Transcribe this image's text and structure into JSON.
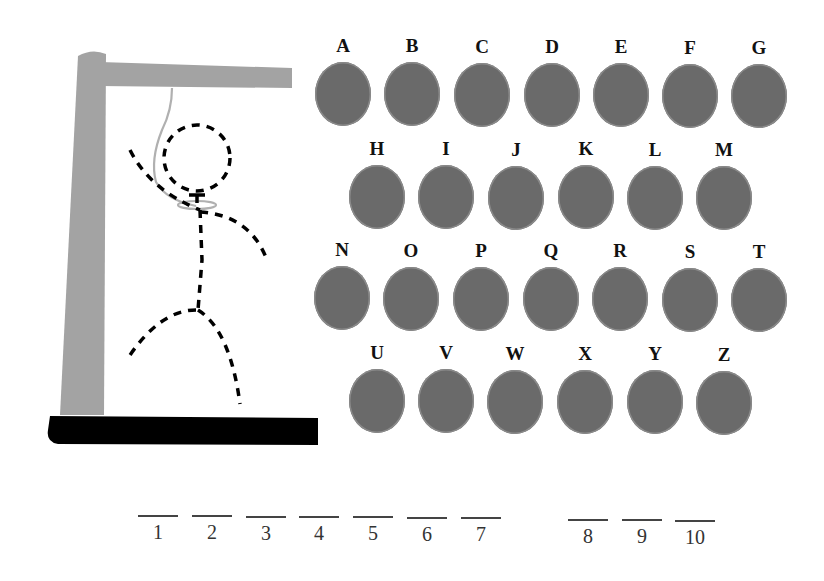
{
  "gallows": {
    "post_color": "#a3a3a3",
    "base_color": "#000000",
    "rope_color": "#b0b0b0",
    "figure_color": "#000000",
    "figure_style": "dashed",
    "parts_drawn": [
      "head",
      "body",
      "left-arm",
      "right-arm",
      "left-leg",
      "right-leg"
    ]
  },
  "letters": {
    "disc_color": "#6a6a6a",
    "rows": [
      [
        "A",
        "B",
        "C",
        "D",
        "E",
        "F",
        "G"
      ],
      [
        "H",
        "I",
        "J",
        "K",
        "L",
        "M"
      ],
      [
        "N",
        "O",
        "P",
        "Q",
        "R",
        "S",
        "T"
      ],
      [
        "U",
        "V",
        "W",
        "X",
        "Y",
        "Z"
      ]
    ]
  },
  "word": {
    "length": 10,
    "groups": [
      7,
      3
    ],
    "blanks": [
      "1",
      "2",
      "3",
      "4",
      "5",
      "6",
      "7",
      "8",
      "9",
      "10"
    ]
  }
}
